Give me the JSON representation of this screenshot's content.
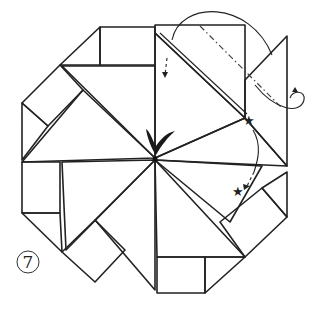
{
  "figure": {
    "step_number": "7",
    "colors": {
      "dark_gray": "#a9a9a9",
      "mid_gray": "#bdbdbd",
      "light_gray": "#d4d4d4",
      "white": "#ffffff",
      "line": "#222222"
    },
    "symbols": [
      "valley-fold-arrow",
      "star-mark",
      "star-mark",
      "check-mark",
      "fold-behind-arrow"
    ]
  }
}
